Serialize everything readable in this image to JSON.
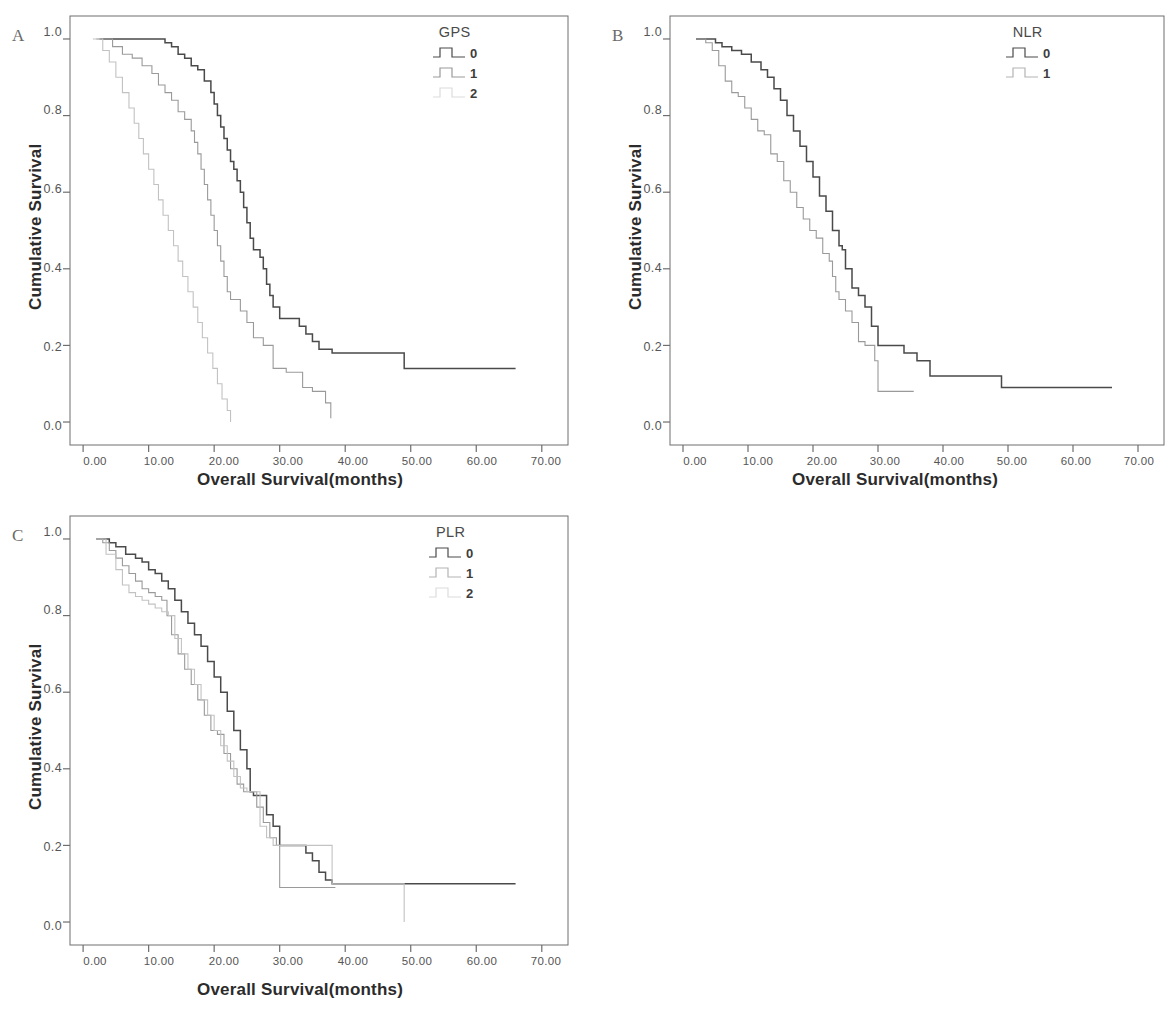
{
  "figure": {
    "panels": [
      {
        "letter": "A",
        "legend_title": "GPS",
        "ylabel": "Cumulative Survival",
        "xlabel": "Overall Survival(months)"
      },
      {
        "letter": "B",
        "legend_title": "NLR",
        "ylabel": "Cumulative Survival",
        "xlabel": "Overall Survival(months)"
      },
      {
        "letter": "C",
        "legend_title": "PLR",
        "ylabel": "Cumulative Survival",
        "xlabel": "Overall Survival(months)"
      }
    ],
    "axis": {
      "yticks": [
        "1.0",
        "0.8",
        "0.6",
        "0.4",
        "0.2",
        "0.0"
      ],
      "xticks": [
        "0.00",
        "10.00",
        "20.00",
        "30.00",
        "40.00",
        "50.00",
        "60.00",
        "70.00"
      ]
    },
    "colors": {
      "series0": "#4a4a4a",
      "series1": "#9a9a9a",
      "series2": "#c2c2c2",
      "axis": "#6e6e6e",
      "text": "#2b2b2b"
    }
  },
  "chart_data": [
    {
      "type": "line",
      "title": "A",
      "subtitle": "Kaplan-Meier overall survival by GPS",
      "xlabel": "Overall Survival(months)",
      "ylabel": "Cumulative Survival",
      "xlim": [
        -2,
        74
      ],
      "ylim": [
        -0.06,
        1.06
      ],
      "xticks": [
        0,
        10,
        20,
        30,
        40,
        50,
        60,
        70
      ],
      "yticks": [
        0.0,
        0.2,
        0.4,
        0.6,
        0.8,
        1.0
      ],
      "grid": false,
      "legend_title": "GPS",
      "legend_position": "top-right",
      "step": "post",
      "series": [
        {
          "name": "0",
          "color": "#4a4a4a",
          "x": [
            2.5,
            3.5,
            11.5,
            12.5,
            13.5,
            14.5,
            15.5,
            16.5,
            17.5,
            18.5,
            19.5,
            20.0,
            20.5,
            21.0,
            21.5,
            22.0,
            22.5,
            23.0,
            23.5,
            24.0,
            24.5,
            25.0,
            25.5,
            26.0,
            26.5,
            27.0,
            27.5,
            28.0,
            28.5,
            29.0,
            30.0,
            31.5,
            33.0,
            34.0,
            35.0,
            36.0,
            38.0,
            49.0,
            66.0
          ],
          "y": [
            1.0,
            1.0,
            1.0,
            0.99,
            0.98,
            0.96,
            0.95,
            0.93,
            0.92,
            0.89,
            0.86,
            0.83,
            0.8,
            0.77,
            0.74,
            0.71,
            0.68,
            0.66,
            0.63,
            0.6,
            0.56,
            0.52,
            0.48,
            0.45,
            0.45,
            0.43,
            0.4,
            0.36,
            0.33,
            0.3,
            0.27,
            0.27,
            0.25,
            0.23,
            0.21,
            0.19,
            0.18,
            0.14,
            0.14
          ]
        },
        {
          "name": "1",
          "color": "#9a9a9a",
          "x": [
            2.0,
            4.5,
            6.0,
            7.5,
            9.0,
            10.5,
            11.5,
            12.5,
            13.5,
            14.5,
            15.5,
            16.5,
            17.0,
            17.5,
            18.0,
            18.5,
            19.0,
            19.5,
            20.0,
            20.5,
            21.0,
            21.5,
            22.0,
            22.5,
            23.0,
            24.0,
            25.0,
            26.0,
            27.5,
            29.0,
            31.0,
            33.5,
            35.0,
            37.0,
            37.8
          ],
          "y": [
            1.0,
            0.98,
            0.96,
            0.95,
            0.93,
            0.91,
            0.88,
            0.86,
            0.84,
            0.81,
            0.79,
            0.76,
            0.73,
            0.7,
            0.66,
            0.62,
            0.58,
            0.54,
            0.5,
            0.46,
            0.42,
            0.38,
            0.34,
            0.32,
            0.32,
            0.29,
            0.26,
            0.22,
            0.2,
            0.14,
            0.13,
            0.09,
            0.08,
            0.05,
            0.01
          ]
        },
        {
          "name": "2",
          "color": "#c2c2c2",
          "x": [
            1.5,
            3.0,
            4.0,
            5.0,
            6.0,
            7.0,
            7.8,
            8.5,
            9.2,
            10.0,
            10.8,
            11.5,
            12.2,
            13.0,
            13.8,
            14.5,
            15.2,
            16.0,
            16.8,
            17.5,
            18.2,
            19.0,
            19.8,
            20.5,
            21.2,
            22.0,
            22.5
          ],
          "y": [
            1.0,
            0.97,
            0.94,
            0.9,
            0.86,
            0.82,
            0.78,
            0.74,
            0.7,
            0.66,
            0.62,
            0.58,
            0.54,
            0.5,
            0.46,
            0.42,
            0.38,
            0.34,
            0.3,
            0.26,
            0.22,
            0.18,
            0.14,
            0.1,
            0.06,
            0.03,
            0.0
          ]
        }
      ]
    },
    {
      "type": "line",
      "title": "B",
      "subtitle": "Kaplan-Meier overall survival by NLR",
      "xlabel": "Overall Survival(months)",
      "ylabel": "Cumulative Survival",
      "xlim": [
        -2,
        74
      ],
      "ylim": [
        -0.06,
        1.06
      ],
      "xticks": [
        0,
        10,
        20,
        30,
        40,
        50,
        60,
        70
      ],
      "yticks": [
        0.0,
        0.2,
        0.4,
        0.6,
        0.8,
        1.0
      ],
      "grid": false,
      "legend_title": "NLR",
      "legend_position": "top-right",
      "step": "post",
      "series": [
        {
          "name": "0",
          "color": "#4a4a4a",
          "x": [
            2.0,
            3.5,
            5.0,
            6.0,
            7.5,
            9.0,
            10.5,
            12.0,
            13.0,
            14.0,
            15.0,
            16.0,
            17.0,
            18.0,
            19.0,
            20.0,
            21.0,
            22.0,
            23.0,
            24.0,
            24.5,
            25.0,
            26.0,
            27.0,
            28.0,
            29.0,
            30.0,
            31.5,
            33.0,
            34.0,
            36.0,
            38.0,
            49.0,
            66.0
          ],
          "y": [
            1.0,
            1.0,
            0.99,
            0.98,
            0.97,
            0.96,
            0.94,
            0.92,
            0.9,
            0.87,
            0.84,
            0.8,
            0.76,
            0.72,
            0.68,
            0.64,
            0.59,
            0.55,
            0.5,
            0.46,
            0.45,
            0.4,
            0.35,
            0.33,
            0.3,
            0.25,
            0.2,
            0.2,
            0.2,
            0.18,
            0.16,
            0.12,
            0.09,
            0.09
          ]
        },
        {
          "name": "1",
          "color": "#9a9a9a",
          "x": [
            2.0,
            3.5,
            4.5,
            5.5,
            6.5,
            7.5,
            8.5,
            9.5,
            10.5,
            11.5,
            12.5,
            13.5,
            14.5,
            15.5,
            16.5,
            17.5,
            18.5,
            19.5,
            20.5,
            21.5,
            22.5,
            23.0,
            23.5,
            24.0,
            25.0,
            26.0,
            27.0,
            28.0,
            29.5,
            30.0,
            35.5
          ],
          "y": [
            1.0,
            0.99,
            0.97,
            0.93,
            0.89,
            0.86,
            0.85,
            0.82,
            0.79,
            0.76,
            0.75,
            0.7,
            0.68,
            0.63,
            0.6,
            0.56,
            0.53,
            0.5,
            0.48,
            0.44,
            0.42,
            0.38,
            0.34,
            0.32,
            0.29,
            0.26,
            0.21,
            0.2,
            0.16,
            0.08,
            0.08
          ]
        }
      ]
    },
    {
      "type": "line",
      "title": "C",
      "subtitle": "Kaplan-Meier overall survival by PLR",
      "xlabel": "Overall Survival(months)",
      "ylabel": "Cumulative Survival",
      "xlim": [
        -2,
        74
      ],
      "ylim": [
        -0.06,
        1.06
      ],
      "xticks": [
        0,
        10,
        20,
        30,
        40,
        50,
        60,
        70
      ],
      "yticks": [
        0.0,
        0.2,
        0.4,
        0.6,
        0.8,
        1.0
      ],
      "grid": false,
      "legend_title": "PLR",
      "legend_position": "top-right",
      "step": "post",
      "series": [
        {
          "name": "0",
          "color": "#4a4a4a",
          "x": [
            2.0,
            3.0,
            4.0,
            5.0,
            6.5,
            8.0,
            9.0,
            10.0,
            11.0,
            12.0,
            13.0,
            14.0,
            15.0,
            16.0,
            17.0,
            18.0,
            19.0,
            20.0,
            21.0,
            22.0,
            23.0,
            24.0,
            25.0,
            25.5,
            26.0,
            27.0,
            28.0,
            29.0,
            30.0,
            33.0,
            34.0,
            35.0,
            36.0,
            37.0,
            38.0,
            66.0
          ],
          "y": [
            1.0,
            1.0,
            0.99,
            0.98,
            0.96,
            0.95,
            0.94,
            0.92,
            0.91,
            0.89,
            0.87,
            0.84,
            0.81,
            0.78,
            0.75,
            0.72,
            0.68,
            0.64,
            0.6,
            0.55,
            0.5,
            0.45,
            0.4,
            0.34,
            0.33,
            0.33,
            0.28,
            0.25,
            0.2,
            0.2,
            0.18,
            0.16,
            0.13,
            0.11,
            0.1,
            0.1
          ]
        },
        {
          "name": "1",
          "color": "#9a9a9a",
          "x": [
            2.0,
            3.0,
            4.0,
            5.0,
            6.0,
            7.0,
            8.0,
            9.0,
            10.0,
            11.0,
            12.0,
            12.8,
            13.5,
            14.5,
            15.5,
            16.5,
            17.5,
            18.5,
            19.5,
            20.5,
            21.5,
            22.5,
            23.5,
            24.5,
            25.5,
            26.5,
            27.5,
            28.5,
            29.5,
            30.0,
            38.5
          ],
          "y": [
            1.0,
            0.99,
            0.97,
            0.95,
            0.93,
            0.91,
            0.89,
            0.87,
            0.86,
            0.85,
            0.84,
            0.8,
            0.75,
            0.7,
            0.66,
            0.62,
            0.58,
            0.54,
            0.5,
            0.49,
            0.44,
            0.4,
            0.36,
            0.34,
            0.34,
            0.3,
            0.26,
            0.22,
            0.2,
            0.09,
            0.09
          ]
        },
        {
          "name": "2",
          "color": "#c2c2c2",
          "x": [
            2.0,
            3.5,
            5.0,
            6.0,
            7.0,
            8.0,
            9.0,
            10.0,
            11.0,
            12.0,
            13.0,
            14.0,
            15.0,
            16.0,
            17.0,
            18.0,
            19.0,
            20.0,
            21.0,
            22.0,
            23.0,
            24.0,
            25.0,
            26.0,
            27.0,
            28.0,
            29.0,
            30.0,
            33.0,
            38.0,
            49.0,
            49.0
          ],
          "y": [
            1.0,
            0.96,
            0.92,
            0.88,
            0.86,
            0.85,
            0.84,
            0.83,
            0.82,
            0.81,
            0.8,
            0.74,
            0.7,
            0.66,
            0.62,
            0.58,
            0.54,
            0.5,
            0.46,
            0.42,
            0.38,
            0.35,
            0.34,
            0.34,
            0.25,
            0.22,
            0.2,
            0.2,
            0.2,
            0.1,
            0.1,
            0.0
          ]
        }
      ]
    }
  ]
}
